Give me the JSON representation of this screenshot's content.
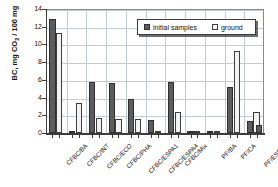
{
  "chart_data": {
    "type": "bar",
    "title": "",
    "xlabel": "",
    "ylabel": "BC, mg CO2 / 100 mg",
    "ylabel_prefix": "BC, mg CO",
    "ylabel_sub": "2",
    "ylabel_suffix": " / 100 mg",
    "ylim": [
      0,
      14
    ],
    "yticks": [
      0,
      2,
      4,
      6,
      8,
      10,
      12,
      14
    ],
    "ytick_labels": [
      "0",
      "2",
      "4",
      "6",
      "8",
      "10",
      "12",
      "14"
    ],
    "grid": true,
    "legend_position": "upper-right-inside",
    "categories": [
      "CFBC/BA",
      "CFBC/INT",
      "CFBC/ECO",
      "CFBC/PHA",
      "CFBC/ESPA1",
      "CFBC/ESPA4",
      "CFBC/Mix",
      "",
      "PF/BA",
      "PF/CA",
      "PF/ESPA1"
    ],
    "series": [
      {
        "name": "initial samples",
        "color": "#5c5c5c",
        "values": [
          12.85,
          0.2,
          5.75,
          5.7,
          3.85,
          1.45,
          5.8,
          0.0,
          0.1,
          5.2,
          1.4
        ]
      },
      {
        "name": "ground",
        "color": "#f2f2f2",
        "values": [
          11.3,
          3.4,
          1.75,
          1.6,
          1.6,
          0.15,
          2.35,
          0.0,
          0.1,
          9.3,
          2.4
        ]
      }
    ],
    "extra_bars": [
      {
        "label": "trailing-initial",
        "series": "initial samples",
        "value": 0.85
      }
    ]
  },
  "legend": {
    "items": [
      {
        "label": "initial samples",
        "swatch": "dark-square-swatch"
      },
      {
        "label": "ground",
        "swatch": "light-square-swatch"
      }
    ]
  }
}
